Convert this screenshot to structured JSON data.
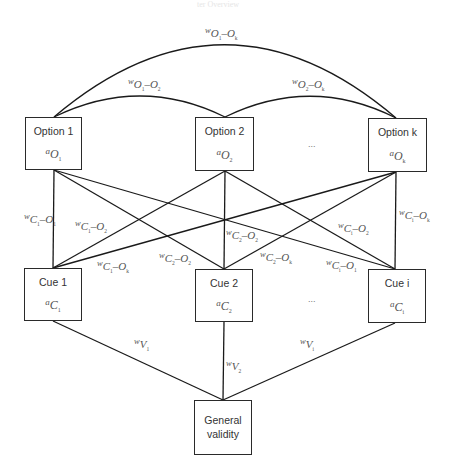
{
  "header": {
    "faint_text": "ter Overview"
  },
  "nodes": {
    "option1": {
      "title": "Option 1",
      "act_main": "O",
      "act_sub": "1"
    },
    "option2": {
      "title": "Option 2",
      "act_main": "O",
      "act_sub": "2"
    },
    "optionk": {
      "title": "Option k",
      "act_main": "O",
      "act_sub": "k"
    },
    "cue1": {
      "title": "Cue 1",
      "act_main": "C",
      "act_sub": "1"
    },
    "cue2": {
      "title": "Cue 2",
      "act_main": "C",
      "act_sub": "2"
    },
    "cuei": {
      "title": "Cue i",
      "act_main": "C",
      "act_sub": "i"
    },
    "validity": {
      "title_line1": "General",
      "title_line2": "validity"
    }
  },
  "activation_prefix": "a",
  "weight_prefix": "w",
  "ellipsis": {
    "options": "...",
    "cues": "..."
  },
  "edge_labels": {
    "o1_ok": {
      "main": "O",
      "sub": "1",
      "dash": "–",
      "main2": "O",
      "sub2": "k"
    },
    "o1_o2": {
      "main": "O",
      "sub": "1",
      "dash": "–",
      "main2": "O",
      "sub2": "2"
    },
    "o2_ok": {
      "main": "O",
      "sub": "2",
      "dash": "–",
      "main2": "O",
      "sub2": "k"
    },
    "c1_o1": {
      "main": "C",
      "sub": "1",
      "dash": "–",
      "main2": "O",
      "sub2": "1"
    },
    "c1_o2": {
      "main": "C",
      "sub": "1",
      "dash": "–",
      "main2": "O",
      "sub2": "2"
    },
    "c1_ok": {
      "main": "C",
      "sub": "1",
      "dash": "–",
      "main2": "O",
      "sub2": "k"
    },
    "c2_o2_left": {
      "main": "C",
      "sub": "2",
      "dash": "–",
      "main2": "O",
      "sub2": "2"
    },
    "c2_o2_mid": {
      "main": "C",
      "sub": "2",
      "dash": "–",
      "main2": "O",
      "sub2": "2"
    },
    "c2_ok": {
      "main": "C",
      "sub": "2",
      "dash": "–",
      "main2": "O",
      "sub2": "k"
    },
    "ci_o2": {
      "main": "C",
      "sub": "i",
      "dash": "–",
      "main2": "O",
      "sub2": "2"
    },
    "ci_o1": {
      "main": "C",
      "sub": "i",
      "dash": "–",
      "main2": "O",
      "sub2": "1"
    },
    "ci_ok": {
      "main": "C",
      "sub": "i",
      "dash": "–",
      "main2": "O",
      "sub2": "k"
    },
    "v1": {
      "main": "V",
      "sub": "1"
    },
    "v2": {
      "main": "V",
      "sub": "2"
    },
    "vi": {
      "main": "V",
      "sub": "i"
    }
  }
}
